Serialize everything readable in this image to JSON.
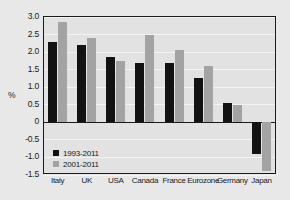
{
  "chart_data": {
    "type": "bar",
    "title": "",
    "xlabel": "",
    "ylabel": "%",
    "ylim": [
      -1.5,
      3.0
    ],
    "ytick_labels": [
      "3.0",
      "2.5",
      "2.0",
      "1.5",
      "1.0",
      "0.5",
      "0",
      "-0.5",
      "-1.0",
      "-1.5"
    ],
    "ytick_values": [
      3.0,
      2.5,
      2.0,
      1.5,
      1.0,
      0.5,
      0,
      -0.5,
      -1.0,
      -1.5
    ],
    "grid": true,
    "legend_position": "bottom-left",
    "categories": [
      "Italy",
      "UK",
      "USA",
      "Canada",
      "France",
      "Eurozone",
      "Germany",
      "Japan"
    ],
    "series": [
      {
        "name": "1993-2011",
        "color": "#121212",
        "values": [
          2.3,
          2.2,
          1.85,
          1.7,
          1.7,
          1.25,
          0.55,
          -0.9
        ]
      },
      {
        "name": "2001-2011",
        "color": "#a3a3a3",
        "values": [
          2.85,
          2.4,
          1.75,
          2.5,
          2.05,
          1.6,
          0.48,
          -1.4
        ]
      }
    ]
  }
}
